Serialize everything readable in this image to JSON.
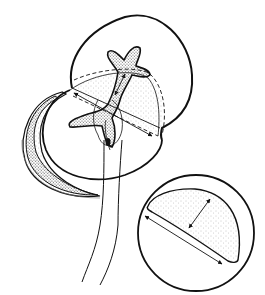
{
  "figure": {
    "type": "scientific line illustration",
    "width": 265,
    "height": 295,
    "background": "#ffffff",
    "ink_color": "#111111",
    "stipple_color": "#9a9a9a",
    "elements": [
      {
        "name": "large-circle-outline",
        "description": "upper large rounded outline"
      },
      {
        "name": "crescent-outline",
        "description": "left crescent with dark hatched band"
      },
      {
        "name": "stellate-shape",
        "description": "star-like branched body with stippling"
      },
      {
        "name": "stippled-hemisphere",
        "description": "dotted dome region with dashed border"
      },
      {
        "name": "double-arrows",
        "description": "measurement double-headed arrows"
      },
      {
        "name": "stalk-lines",
        "description": "two long descending lines"
      },
      {
        "name": "inset-circle",
        "description": "lower right inset with stippled half-disc and two measurement arrows"
      }
    ]
  }
}
